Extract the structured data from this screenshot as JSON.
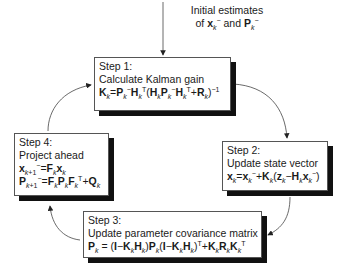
{
  "initial": {
    "line1": "Initial estimates",
    "line2_prefix": "of ",
    "line2_var1": "x",
    "line2_sub1": "k",
    "line2_sup1": "−",
    "line2_mid": " and ",
    "line2_var2": "P",
    "line2_sub2": "k",
    "line2_sup2": "−"
  },
  "steps": [
    {
      "id": 1,
      "title": "Step 1:",
      "description": "Calculate Kalman gain",
      "equations": [
        "K_k = P_k^- H_k^T (H_k P_k^- H_k^T + R_k)^-1"
      ]
    },
    {
      "id": 2,
      "title": "Step 2:",
      "description": "Update state vector",
      "equations": [
        "x_k = x_k^- + K_k (z_k − H_k x_k^-)"
      ]
    },
    {
      "id": 3,
      "title": "Step 3:",
      "description": "Update parameter covariance matrix",
      "equations": [
        "P_k = (I − K_k H_k) P_k (I − K_k H_k)^T + K_k R_k K_k^T"
      ]
    },
    {
      "id": 4,
      "title": "Step 4:",
      "description": "Project ahead",
      "equations": [
        "x_k+1^- = F_k x_k",
        "P_k+1^- = F_k P_k F_k^T + Q_k"
      ]
    }
  ],
  "colors": {
    "box_border": "#555555",
    "shadow": "#111111",
    "arrow": "#444444",
    "background": "#ffffff"
  }
}
